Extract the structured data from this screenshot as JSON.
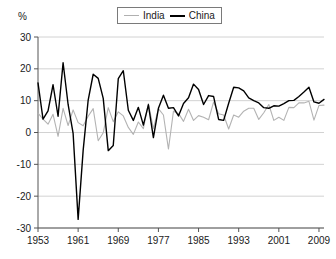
{
  "chart_data": {
    "type": "line",
    "title": "",
    "subtitle": "",
    "xlabel": "",
    "ylabel": "%",
    "unit_label": "%",
    "xlim": [
      1953,
      2010
    ],
    "ylim": [
      -30,
      30
    ],
    "grid": true,
    "legend_position": "top-center",
    "y_ticks": [
      30,
      20,
      10,
      0,
      -10,
      -20,
      -30
    ],
    "y_tick_labels": [
      "30",
      "20",
      "10",
      "0",
      "-10",
      "-20",
      "-30"
    ],
    "x_ticks": [
      1953,
      1961,
      1969,
      1977,
      1985,
      1993,
      2001,
      2009
    ],
    "x_tick_labels": [
      "1953",
      "1961",
      "1969",
      "1977",
      "1985",
      "1993",
      "2001",
      "2009"
    ],
    "x": [
      1953,
      1954,
      1955,
      1956,
      1957,
      1958,
      1959,
      1960,
      1961,
      1962,
      1963,
      1964,
      1965,
      1966,
      1967,
      1968,
      1969,
      1970,
      1971,
      1972,
      1973,
      1974,
      1975,
      1976,
      1977,
      1978,
      1979,
      1980,
      1981,
      1982,
      1983,
      1984,
      1985,
      1986,
      1987,
      1988,
      1989,
      1990,
      1991,
      1992,
      1993,
      1994,
      1995,
      1996,
      1997,
      1998,
      1999,
      2000,
      2001,
      2002,
      2003,
      2004,
      2005,
      2006,
      2007,
      2008,
      2009,
      2010
    ],
    "series": [
      {
        "name": "India",
        "color": "#b3b3b3",
        "values": [
          6.1,
          4.2,
          2.6,
          5.7,
          -1.2,
          7.6,
          2.2,
          7.1,
          3.1,
          2.1,
          5.1,
          7.5,
          -2.6,
          -0.1,
          7.8,
          3.4,
          6.5,
          5.2,
          1.6,
          -0.6,
          3.3,
          1.2,
          9.1,
          1.2,
          7.5,
          5.5,
          -5.2,
          6.7,
          6.0,
          3.5,
          7.3,
          3.8,
          5.3,
          4.8,
          4.0,
          9.6,
          5.9,
          5.5,
          1.1,
          5.5,
          4.8,
          6.7,
          7.6,
          7.6,
          4.1,
          6.2,
          8.8,
          3.8,
          4.8,
          3.8,
          7.9,
          7.8,
          9.3,
          9.3,
          9.8,
          3.9,
          8.5,
          8.6
        ]
      },
      {
        "name": "China",
        "color": "#000000",
        "values": [
          15.6,
          4.2,
          6.8,
          15.0,
          5.1,
          21.9,
          8.8,
          -0.3,
          -27.3,
          -5.6,
          10.2,
          18.3,
          17.0,
          10.7,
          -5.7,
          -4.1,
          16.9,
          19.4,
          7.0,
          3.8,
          7.9,
          2.3,
          8.7,
          -1.6,
          7.6,
          11.7,
          7.6,
          7.8,
          5.2,
          9.1,
          10.9,
          15.2,
          13.5,
          8.8,
          11.6,
          11.3,
          4.1,
          3.8,
          9.2,
          14.2,
          14.0,
          13.1,
          10.9,
          10.0,
          9.3,
          7.8,
          7.6,
          8.4,
          8.3,
          9.1,
          10.0,
          10.1,
          11.3,
          12.7,
          14.2,
          9.6,
          9.2,
          10.4
        ]
      }
    ]
  }
}
